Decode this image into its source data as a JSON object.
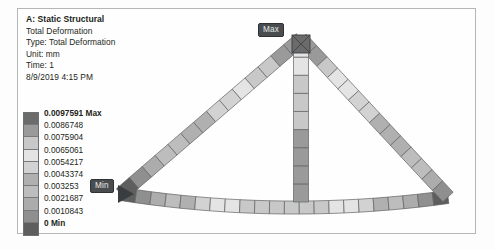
{
  "result_info": {
    "analysis_title": "A: Static Structural",
    "result_name": "Total Deformation",
    "type_line": "Type: Total Deformation",
    "unit_line": "Unit: mm",
    "time_line": "Time: 1",
    "timestamp": "8/9/2019 4:15 PM"
  },
  "legend": {
    "max_label": "0.0097591 Max",
    "min_label": "0 Min",
    "bands": [
      {
        "value": "0.0097591 Max",
        "color": "#6b6b6b"
      },
      {
        "value": "0.0086748",
        "color": "#9a9a9a"
      },
      {
        "value": "0.0075904",
        "color": "#c8c8c8"
      },
      {
        "value": "0.0065061",
        "color": "#e4e4e4"
      },
      {
        "value": "0.0054217",
        "color": "#d2d2d2"
      },
      {
        "value": "0.0043374",
        "color": "#b0b0b0"
      },
      {
        "value": "0.003253",
        "color": "#bdbdbd"
      },
      {
        "value": "0.0021687",
        "color": "#acacac"
      },
      {
        "value": "0.0010843",
        "color": "#8f8f8f"
      },
      {
        "value": "0 Min",
        "color": "#5e5e5e"
      }
    ]
  },
  "probes": {
    "max": "Max",
    "min": "Min"
  },
  "chart_data": {
    "type": "heatmap",
    "title": "Total Deformation",
    "unit": "mm",
    "colormap": "grayscale-rainbow",
    "range": [
      0,
      0.0097591
    ],
    "contour_levels": [
      0,
      0.0010843,
      0.0021687,
      0.003253,
      0.0043374,
      0.0054217,
      0.0065061,
      0.0075904,
      0.0086748,
      0.0097591
    ],
    "annotations": [
      {
        "label": "Max",
        "value": 0.0097591,
        "location": "truss apex / top of vertical column"
      },
      {
        "label": "Min",
        "value": 0.0,
        "location": "left support joint"
      }
    ],
    "members": [
      {
        "name": "left-diagonal",
        "element_values": [
          0.0096,
          0.0091,
          0.0084,
          0.0076,
          0.0068,
          0.0061,
          0.0055,
          0.005,
          0.0046,
          0.0042,
          0.0036,
          0.0028,
          0.0018,
          0.0008
        ]
      },
      {
        "name": "right-diagonal",
        "element_values": [
          0.0095,
          0.0088,
          0.008,
          0.0072,
          0.0066,
          0.006,
          0.0055,
          0.0051,
          0.0047,
          0.0044,
          0.004,
          0.0034,
          0.0026,
          0.0014
        ]
      },
      {
        "name": "vertical-column",
        "element_values": [
          0.0097,
          0.0093,
          0.009,
          0.0087,
          0.0084,
          0.0081,
          0.0078,
          0.0075,
          0.0072
        ]
      },
      {
        "name": "bottom-chord",
        "element_values": [
          0.0006,
          0.0014,
          0.0026,
          0.0039,
          0.005,
          0.0059,
          0.0066,
          0.0072,
          0.0077,
          0.008,
          0.0082,
          0.0083,
          0.0082,
          0.0079,
          0.0075,
          0.0069,
          0.0062,
          0.0053,
          0.0043,
          0.0032,
          0.002,
          0.0009
        ]
      }
    ]
  }
}
